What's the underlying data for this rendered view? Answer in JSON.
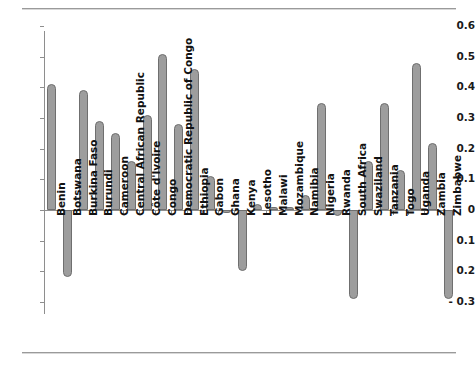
{
  "page": {
    "background_color": "#ffffff",
    "rule_color": "#9a9a9a"
  },
  "axis": {
    "y_ticks": [
      "0.6",
      "0.5",
      "0.4",
      "0.3",
      "0.2",
      "0.1",
      "0",
      "- 0.1",
      "- 0.2",
      "- 0.3"
    ],
    "y_tick_values": [
      0.6,
      0.5,
      0.4,
      0.3,
      0.2,
      0.1,
      0,
      -0.1,
      -0.2,
      -0.3
    ],
    "zero_label": "0"
  },
  "chart_data": {
    "type": "bar",
    "title": "",
    "subtitle": "",
    "xlabel": "",
    "ylabel": "",
    "ylim": [
      -0.3,
      0.6
    ],
    "grid": false,
    "legend": false,
    "orientation": "vertical",
    "bar_color": "#9d9d9d",
    "bar_edge_color": "#6f6f6f",
    "categories": [
      "Benin",
      "Botswana",
      "Burkina Faso",
      "Burundi",
      "Cameroon",
      "Central African Republic",
      "Côte d'Ivoire",
      "Congo",
      "Democratic Republic of Congo",
      "Ethiopia",
      "Gabon",
      "Ghana",
      "Kenya",
      "Lesotho",
      "Malawi",
      "Mozambique",
      "Namibia",
      "Nigeria",
      "Rwanda",
      "South Africa",
      "Swaziland",
      "Tanzania",
      "Togo",
      "Uganda",
      "Zambia",
      "Zimbabwe"
    ],
    "values": [
      0.41,
      -0.22,
      0.39,
      0.29,
      0.25,
      0.16,
      0.31,
      0.51,
      0.28,
      0.46,
      0.11,
      -0.01,
      -0.2,
      0.02,
      0.01,
      0.01,
      0.05,
      0.35,
      -0.02,
      -0.29,
      0.16,
      0.35,
      0.13,
      0.48,
      0.22,
      -0.29
    ]
  }
}
